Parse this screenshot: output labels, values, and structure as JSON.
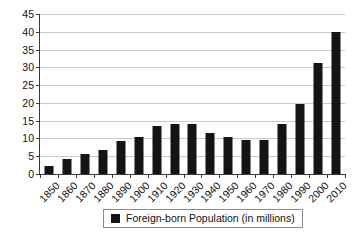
{
  "chart_data": {
    "type": "bar",
    "title": "",
    "xlabel": "",
    "ylabel": "",
    "categories": [
      "1850",
      "1860",
      "1870",
      "1880",
      "1890",
      "1900",
      "1910",
      "1920",
      "1930",
      "1940",
      "1950",
      "1960",
      "1970",
      "1980",
      "1990",
      "2000",
      "2010"
    ],
    "values": [
      2.2,
      4.1,
      5.6,
      6.7,
      9.2,
      10.3,
      13.5,
      14.0,
      14.2,
      11.6,
      10.3,
      9.7,
      9.6,
      14.1,
      19.8,
      31.1,
      40.0
    ],
    "series": [
      {
        "name": "Foreign-born Population (in millions)",
        "values": [
          2.2,
          4.1,
          5.6,
          6.7,
          9.2,
          10.3,
          13.5,
          14.0,
          14.2,
          11.6,
          10.3,
          9.7,
          9.6,
          14.1,
          19.8,
          31.1,
          40.0
        ],
        "color": "#141414"
      }
    ],
    "ylim": [
      0,
      45
    ],
    "y_ticks": [
      0,
      5,
      10,
      15,
      20,
      25,
      30,
      35,
      40,
      45
    ],
    "y_tick_labels": [
      "0",
      "5",
      "10",
      "15",
      "20",
      "25",
      "30",
      "35",
      "40",
      "45"
    ],
    "grid": true,
    "grid_axis": "y",
    "legend": {
      "position": "bottom",
      "entries": [
        {
          "label": "Foreign-born Population (in millions)",
          "color": "#141414",
          "marker": "square"
        }
      ]
    },
    "x_tick_rotation": -45,
    "bar_color": "#141414",
    "background_color": "#ffffff",
    "axis_color": "#3a3a3a",
    "gridline_color": "#c8c8c8"
  }
}
